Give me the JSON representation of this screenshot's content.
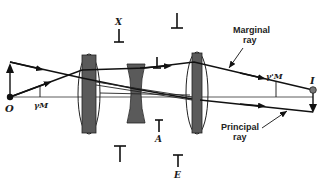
{
  "diagram": {
    "labels": {
      "object": "O",
      "image": "I",
      "object_angle": "γM",
      "image_angle": "γ'M",
      "stop_x": "X",
      "stop_a": "A",
      "stop_e": "E",
      "marginal_ray_line1": "Marginal",
      "marginal_ray_line2": "ray",
      "principal_ray_line1": "Principal",
      "principal_ray_line2": "ray"
    },
    "elements": [
      {
        "name": "positive-lens-1",
        "type": "converging lens"
      },
      {
        "name": "negative-lens",
        "type": "diverging lens"
      },
      {
        "name": "positive-lens-2",
        "type": "converging lens"
      }
    ],
    "colors": {
      "ink": "#111111",
      "lens_fill": "#5a5a5a",
      "background": "#ffffff"
    }
  }
}
